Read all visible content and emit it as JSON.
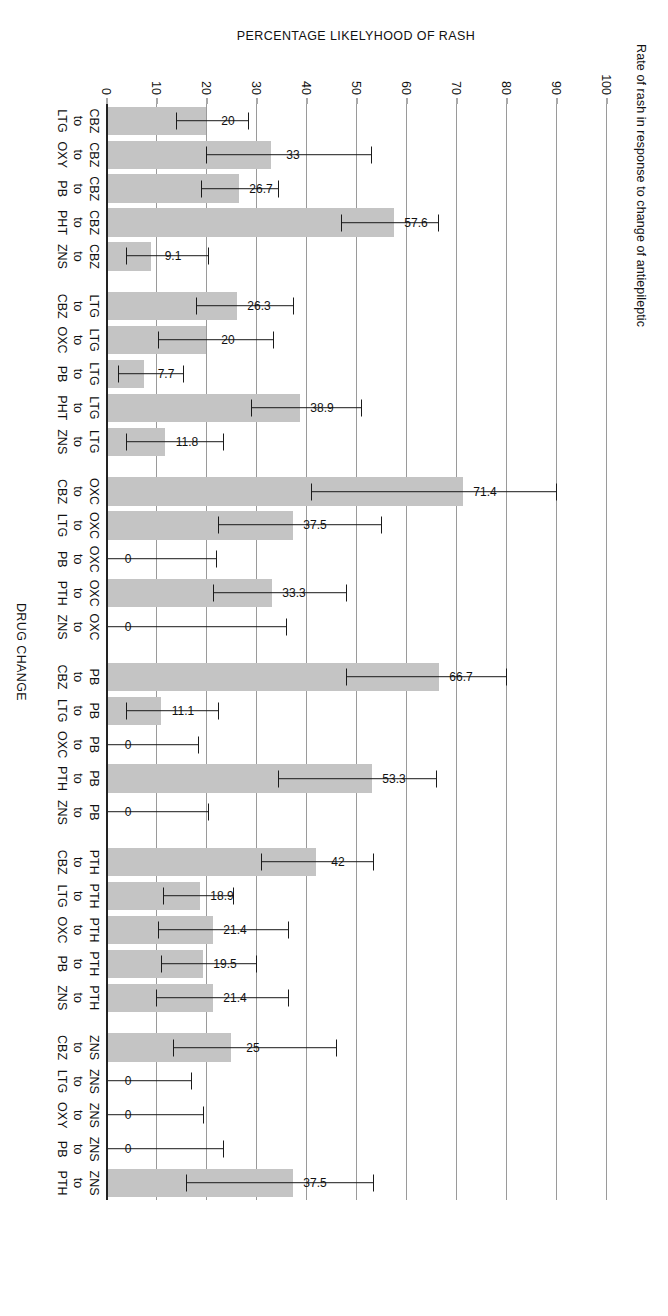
{
  "chart_data": {
    "type": "bar",
    "title": "Rate of rash in response to change of antiepileptic",
    "xlabel": "DRUG CHANGE",
    "ylabel": "PERCENTAGE LIKELYHOOD OF RASH",
    "ylim": [
      0,
      100
    ],
    "yticks": [
      0,
      10,
      20,
      30,
      40,
      50,
      60,
      70,
      80,
      90,
      100
    ],
    "grid": true,
    "legend": "none",
    "orientation": "vertical-bars-rotated-page",
    "bar_color": "#c4c4c4",
    "error_bar_color": "#1a1a1a",
    "categories": [
      "CBZ to LTG",
      "CBZ to OXY",
      "CBZ to PB",
      "CBZ to PHT",
      "CBZ to ZNS",
      "LTG to CBZ",
      "LTG to OXC",
      "LTG to PB",
      "LTG to PHT",
      "LTG to ZNS",
      "OXC to CBZ",
      "OXC to LTG",
      "OXC to PB",
      "OXC to PTH",
      "OXC to ZNS",
      "PB to CBZ",
      "PB to LTG",
      "PB to OXC",
      "PB to PTH",
      "PB to ZNS",
      "PTH to CBZ",
      "PTH to LTG",
      "PTH to OXC",
      "PTH to PB",
      "PTH to ZNS",
      "ZNS to CBZ",
      "ZNS to LTG",
      "ZNS to OXY",
      "ZNS to PB",
      "ZNS to PTH"
    ],
    "values": [
      20,
      33,
      26.7,
      57.6,
      9.1,
      26.3,
      20,
      7.7,
      38.9,
      11.8,
      71.4,
      37.5,
      0,
      33.3,
      0,
      66.7,
      11.1,
      0,
      53.3,
      0,
      42,
      18.9,
      21.4,
      19.5,
      21.4,
      25,
      0,
      0,
      0,
      37.5
    ],
    "value_labels": [
      "20",
      "33",
      "26.7",
      "57.6",
      "9.1",
      "26.3",
      "20",
      "7.7",
      "38.9",
      "11.8",
      "71.4",
      "37.5",
      "0",
      "33.3",
      "0",
      "66.7",
      "11.1",
      "0",
      "53.3",
      "0",
      "42",
      "18.9",
      "21.4",
      "19.5",
      "21.4",
      "25",
      "0",
      "0",
      "0",
      "37.5"
    ],
    "error_upper": [
      28.5,
      53,
      34.5,
      66.5,
      20.5,
      37.5,
      33.5,
      15.5,
      51.0,
      23.5,
      90.0,
      55.0,
      22.0,
      48.0,
      36.0,
      80.0,
      22.5,
      18.5,
      66.0,
      20.5,
      53.5,
      25.5,
      36.5,
      30.0,
      36.5,
      46.0,
      17.0,
      19.5,
      23.5,
      53.5
    ],
    "error_lower": [
      14.0,
      20.0,
      19.0,
      47.0,
      4.0,
      18.0,
      10.5,
      2.5,
      29.0,
      4.0,
      41.0,
      22.5,
      0,
      21.5,
      0,
      48.0,
      4.0,
      0,
      34.5,
      0,
      31.0,
      11.5,
      10.5,
      11.0,
      10.0,
      13.5,
      0,
      0,
      0,
      16.0
    ],
    "groups": [
      {
        "from": "CBZ",
        "items": [
          {
            "from": "CBZ",
            "to": "LTG",
            "value": 20,
            "label": "20"
          },
          {
            "from": "CBZ",
            "to": "OXY",
            "value": 33,
            "label": "33"
          },
          {
            "from": "CBZ",
            "to": "PB",
            "value": 26.7,
            "label": "26.7"
          },
          {
            "from": "CBZ",
            "to": "PHT",
            "value": 57.6,
            "label": "57.6"
          },
          {
            "from": "CBZ",
            "to": "ZNS",
            "value": 9.1,
            "label": "9.1"
          }
        ]
      },
      {
        "from": "LTG",
        "items": [
          {
            "from": "LTG",
            "to": "CBZ",
            "value": 26.3,
            "label": "26.3"
          },
          {
            "from": "LTG",
            "to": "OXC",
            "value": 20,
            "label": "20"
          },
          {
            "from": "LTG",
            "to": "PB",
            "value": 7.7,
            "label": "7.7"
          },
          {
            "from": "LTG",
            "to": "PHT",
            "value": 38.9,
            "label": "38.9"
          },
          {
            "from": "LTG",
            "to": "ZNS",
            "value": 11.8,
            "label": "11.8"
          }
        ]
      },
      {
        "from": "OXC",
        "items": [
          {
            "from": "OXC",
            "to": "CBZ",
            "value": 71.4,
            "label": "71.4"
          },
          {
            "from": "OXC",
            "to": "LTG",
            "value": 37.5,
            "label": "37.5"
          },
          {
            "from": "OXC",
            "to": "PB",
            "value": 0,
            "label": "0"
          },
          {
            "from": "OXC",
            "to": "PTH",
            "value": 33.3,
            "label": "33.3"
          },
          {
            "from": "OXC",
            "to": "ZNS",
            "value": 0,
            "label": "0"
          }
        ]
      },
      {
        "from": "PB",
        "items": [
          {
            "from": "PB",
            "to": "CBZ",
            "value": 66.7,
            "label": "66.7"
          },
          {
            "from": "PB",
            "to": "LTG",
            "value": 11.1,
            "label": "11.1"
          },
          {
            "from": "PB",
            "to": "OXC",
            "value": 0,
            "label": "0"
          },
          {
            "from": "PB",
            "to": "PTH",
            "value": 53.3,
            "label": "53.3"
          },
          {
            "from": "PB",
            "to": "ZNS",
            "value": 0,
            "label": "0"
          }
        ]
      },
      {
        "from": "PTH",
        "items": [
          {
            "from": "PTH",
            "to": "CBZ",
            "value": 42,
            "label": "42"
          },
          {
            "from": "PTH",
            "to": "LTG",
            "value": 18.9,
            "label": "18.9"
          },
          {
            "from": "PTH",
            "to": "OXC",
            "value": 21.4,
            "label": "21.4"
          },
          {
            "from": "PTH",
            "to": "PB",
            "value": 19.5,
            "label": "19.5"
          },
          {
            "from": "PTH",
            "to": "ZNS",
            "value": 21.4,
            "label": "21.4"
          }
        ]
      },
      {
        "from": "ZNS",
        "items": [
          {
            "from": "ZNS",
            "to": "CBZ",
            "value": 25,
            "label": "25"
          },
          {
            "from": "ZNS",
            "to": "LTG",
            "value": 0,
            "label": "0"
          },
          {
            "from": "ZNS",
            "to": "OXY",
            "value": 0,
            "label": "0"
          },
          {
            "from": "ZNS",
            "to": "PB",
            "value": 0,
            "label": "0"
          },
          {
            "from": "ZNS",
            "to": "PTH",
            "value": 37.5,
            "label": "37.5"
          }
        ]
      }
    ],
    "connector_word": "to"
  }
}
